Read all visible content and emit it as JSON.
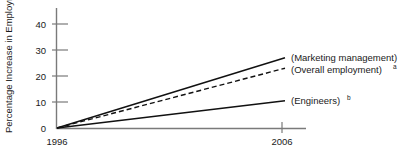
{
  "chart_data": {
    "type": "line",
    "title": "",
    "subtitle": "",
    "xlabel": "",
    "ylabel": "Percentage Increase in Employment",
    "x": [
      1996,
      2006
    ],
    "xtick_labels": [
      "1996",
      "2006"
    ],
    "ytick_labels": [
      "0",
      "10",
      "20",
      "30",
      "40"
    ],
    "yticks": [
      0,
      10,
      20,
      30,
      40
    ],
    "xlim": [
      1996,
      2006
    ],
    "ylim": [
      0,
      45
    ],
    "grid": false,
    "legend_position": "right-inline",
    "series": [
      {
        "name": "(Marketing management)",
        "label": "(Marketing management)",
        "superscript": "",
        "style": "solid",
        "color": "#111111",
        "values": [
          0,
          27
        ]
      },
      {
        "name": "(Overall employment)",
        "label": "(Overall employment)",
        "superscript": "a",
        "style": "dashed",
        "color": "#111111",
        "values": [
          0,
          23
        ]
      },
      {
        "name": "(Engineers)",
        "label": "(Engineers)",
        "superscript": "b",
        "style": "solid",
        "color": "#111111",
        "values": [
          0,
          10.5
        ]
      }
    ]
  },
  "axis": {
    "y_title": "Percentage Increase in Employment",
    "y_tick_0": "0",
    "y_tick_10": "10",
    "y_tick_20": "20",
    "y_tick_30": "30",
    "y_tick_40": "40",
    "x_tick_start": "1996",
    "x_tick_end": "2006"
  },
  "labels": {
    "marketing": "(Marketing management)",
    "marketing_sup": "",
    "overall": "(Overall employment)",
    "overall_sup": "a",
    "engineers": "(Engineers)",
    "engineers_sup": "b"
  },
  "colors": {
    "background": "#ffffff",
    "axis": "#7a7a7a",
    "line": "#111111",
    "text": "#1a1a1a"
  }
}
